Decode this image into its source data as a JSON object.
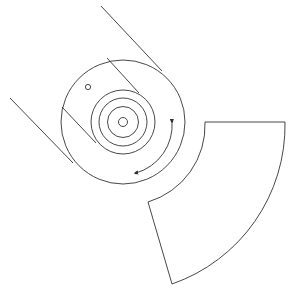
{
  "diagram": {
    "colors": {
      "stroke": "#333333",
      "background": "#ffffff"
    },
    "main_circle": {
      "cx": 123,
      "cy": 122,
      "r": 62
    },
    "rings": [
      {
        "r": 32
      },
      {
        "r": 24
      },
      {
        "r": 15.5
      },
      {
        "r": 4.5
      }
    ],
    "small_hole": {
      "cx": 88,
      "cy": 87,
      "r": 2.6
    },
    "tangent_lines": [
      {
        "x1": 101,
        "y1": 6,
        "x2": 162,
        "y2": 71
      },
      {
        "x1": 10,
        "y1": 98,
        "x2": 73,
        "y2": 163
      }
    ],
    "chords": [
      {
        "x1": 107,
        "y1": 58,
        "x2": 139,
        "y2": 93
      },
      {
        "x1": 62,
        "y1": 107,
        "x2": 96,
        "y2": 143
      }
    ],
    "rotation_arrow": {
      "start": [
        172,
        121
      ],
      "end": [
        136,
        173
      ],
      "direction": "clockwise"
    },
    "sector": {
      "top_left": [
        205,
        122
      ],
      "top_right": [
        285,
        122
      ],
      "bottom": [
        172,
        284
      ],
      "inner_left": [
        148,
        202
      ]
    }
  }
}
